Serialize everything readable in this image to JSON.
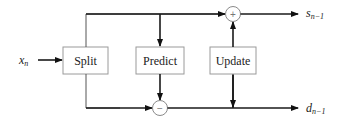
{
  "diagram": {
    "type": "block-diagram",
    "input": {
      "symbol": "x",
      "subscript": "n"
    },
    "blocks": [
      {
        "id": "split",
        "label": "Split"
      },
      {
        "id": "predict",
        "label": "Predict"
      },
      {
        "id": "update",
        "label": "Update"
      }
    ],
    "nodes": [
      {
        "id": "sum",
        "operator": "+"
      },
      {
        "id": "diff",
        "operator": "−"
      }
    ],
    "outputs": [
      {
        "id": "s",
        "symbol": "s",
        "subscript": "n−1"
      },
      {
        "id": "d",
        "symbol": "d",
        "subscript": "n−1"
      }
    ],
    "edges": [
      {
        "from": "x_n",
        "to": "split"
      },
      {
        "from": "split",
        "to": "sum",
        "path": "top"
      },
      {
        "from": "split",
        "to": "diff",
        "path": "bottom"
      },
      {
        "from": "top-branch",
        "to": "predict"
      },
      {
        "from": "predict",
        "to": "diff"
      },
      {
        "from": "bottom-branch",
        "to": "update"
      },
      {
        "from": "update",
        "to": "sum"
      },
      {
        "from": "sum",
        "to": "s_n-1"
      },
      {
        "from": "diff",
        "to": "d_n-1"
      }
    ]
  }
}
